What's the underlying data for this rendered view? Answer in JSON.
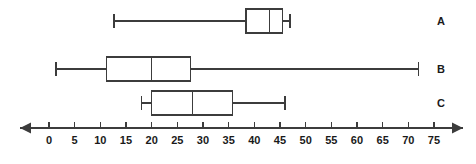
{
  "chart_data": {
    "type": "box",
    "title": "",
    "xlabel": "",
    "ylabel": "",
    "orientation": "horizontal",
    "grid": false,
    "legend": "none",
    "axis": {
      "min": 0,
      "max": 75,
      "tick_step": 5,
      "tick_labels": [
        "0",
        "5",
        "10",
        "15",
        "20",
        "25",
        "30",
        "35",
        "40",
        "45",
        "50",
        "55",
        "60",
        "65",
        "70",
        "75"
      ],
      "tick_values": [
        0,
        5,
        10,
        15,
        20,
        25,
        30,
        35,
        40,
        45,
        50,
        55,
        60,
        65,
        70,
        75
      ],
      "arrow_left": true,
      "arrow_right": true,
      "line_color": "#262626"
    },
    "categories": [
      "A",
      "B",
      "C"
    ],
    "boxes": [
      {
        "label": "A",
        "min": 12.7,
        "q1": 38.4,
        "median": 43,
        "q3": 45.5,
        "max": 47
      },
      {
        "label": "B",
        "min": 1.4,
        "q1": 11.2,
        "median": 20,
        "q3": 27.6,
        "max": 72
      },
      {
        "label": "C",
        "min": 18,
        "q1": 20,
        "median": 28,
        "q3": 35.7,
        "max": 46
      }
    ],
    "colors": {
      "stroke": "#3c3c3c",
      "box_fill": "#ffffff",
      "text": "#1a1a1a"
    }
  }
}
